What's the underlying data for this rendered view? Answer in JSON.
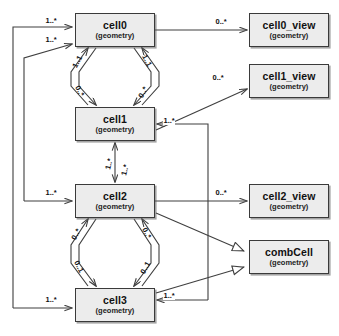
{
  "diagram": {
    "kind": "uml-class-diagram",
    "background_color": "#ffffff",
    "node_fill": "#ececec",
    "node_stroke": "#3a3a3a",
    "line_color": "#3f3f3f",
    "nodes": [
      {
        "id": "cell0",
        "name": "cell0",
        "stereotype": "(geometry)",
        "x": 75,
        "y": 13,
        "w": 80,
        "h": 34
      },
      {
        "id": "cell1",
        "name": "cell1",
        "stereotype": "(geometry)",
        "x": 75,
        "y": 107,
        "h": 34,
        "w": 80
      },
      {
        "id": "cell2",
        "name": "cell2",
        "stereotype": "(geometry)",
        "x": 75,
        "y": 184,
        "w": 80,
        "h": 34
      },
      {
        "id": "cell3",
        "name": "cell3",
        "stereotype": "(geometry)",
        "x": 75,
        "y": 288,
        "w": 80,
        "h": 34
      },
      {
        "id": "cell0_view",
        "name": "cell0_view",
        "stereotype": "(geometry)",
        "x": 249,
        "y": 13,
        "w": 80,
        "h": 34
      },
      {
        "id": "cell1_view",
        "name": "cell1_view",
        "stereotype": "(geometry)",
        "x": 249,
        "y": 64,
        "w": 80,
        "h": 34
      },
      {
        "id": "cell2_view",
        "name": "cell2_view",
        "stereotype": "(geometry)",
        "x": 249,
        "y": 184,
        "w": 80,
        "h": 34
      },
      {
        "id": "combCell",
        "name": "combCell",
        "stereotype": "(geometry)",
        "x": 249,
        "y": 240,
        "w": 80,
        "h": 34
      }
    ],
    "edges": [
      {
        "id": "e-cell0-cell0view",
        "from": "cell0",
        "to": "cell0_view",
        "label": "0..*",
        "arrow": "open"
      },
      {
        "id": "e-cell1-cell1view",
        "from": "cell1",
        "to": "cell1_view",
        "label": "0..*",
        "arrow": "open"
      },
      {
        "id": "e-cell2-cell2view",
        "from": "cell2",
        "to": "cell2_view",
        "label": "0..*",
        "arrow": "open"
      },
      {
        "id": "e-cell0-cell1-down",
        "from": "cell0",
        "to": "cell1",
        "label": "0..*",
        "arrow": "open"
      },
      {
        "id": "e-cell1-cell0-up",
        "from": "cell1",
        "to": "cell0",
        "label": "1..1",
        "arrow": "open"
      },
      {
        "id": "e-cell0-cell1-down2",
        "from": "cell0",
        "to": "cell1",
        "label": "0..*",
        "arrow": "open"
      },
      {
        "id": "e-cell1-cell0-up2",
        "from": "cell1",
        "to": "cell0",
        "label": "1..1",
        "arrow": "open"
      },
      {
        "id": "e-cell1-cell2",
        "from": "cell1",
        "to": "cell2",
        "label": "1..*",
        "arrow": "open-both"
      },
      {
        "id": "e-cell2-cell1",
        "from": "cell2",
        "to": "cell1",
        "label": "1..*",
        "arrow": "open-both"
      },
      {
        "id": "e-cell2-cell3-down",
        "from": "cell2",
        "to": "cell3",
        "label": "0..1",
        "arrow": "open"
      },
      {
        "id": "e-cell3-cell2-up",
        "from": "cell3",
        "to": "cell2",
        "label": "0..*",
        "arrow": "open"
      },
      {
        "id": "e-cell2-cell3-down2",
        "from": "cell2",
        "to": "cell3",
        "label": "0..1",
        "arrow": "open"
      },
      {
        "id": "e-cell3-cell2-up2",
        "from": "cell3",
        "to": "cell2",
        "label": "0..*",
        "arrow": "open"
      },
      {
        "id": "e-loop-cell0-a",
        "from": "cell3",
        "to": "cell0",
        "label": "1..*",
        "arrow": "open"
      },
      {
        "id": "e-loop-cell0-b",
        "from": "cell2",
        "to": "cell0",
        "label": "1..*",
        "arrow": "open"
      },
      {
        "id": "e-loop-cell2",
        "from": "cell3",
        "to": "cell2",
        "label": "1..*",
        "arrow": "open"
      },
      {
        "id": "e-loop-cell3",
        "from": "cell0",
        "to": "cell3",
        "label": "1..*",
        "arrow": "open"
      },
      {
        "id": "e-right-cell1",
        "from": "cell3",
        "to": "cell1",
        "label": "1..*",
        "arrow": "open"
      },
      {
        "id": "e-right-cell3",
        "from": "cell1",
        "to": "cell3",
        "label": "1..*",
        "arrow": "open"
      },
      {
        "id": "e-cell2-combcell",
        "from": "cell2",
        "to": "combCell",
        "label": "",
        "arrow": "generalization"
      },
      {
        "id": "e-cell3-combcell",
        "from": "cell3",
        "to": "combCell",
        "label": "",
        "arrow": "generalization"
      }
    ],
    "labels": {
      "l_top_left_1": "1..*",
      "l_top_left_2": "1..*",
      "l_cell0_view": "0..*",
      "l_cell1_view": "0..*",
      "l_cell2_view": "0..*",
      "l_c0c1_left_up": "1..1",
      "l_c0c1_right_up": "1..1",
      "l_c0c1_left_down": "0..*",
      "l_c0c1_right_down": "0..*",
      "l_c1c2_left": "1..*",
      "l_c1c2_right": "1..*",
      "l_cell1_right_in": "1..*",
      "l_cell2_left_in": "1..*",
      "l_c2c3_left_up": "0..*",
      "l_c2c3_right_up": "0..*",
      "l_c2c3_left_down": "0..1",
      "l_c2c3_right_down": "0..1",
      "l_cell3_left_in": "1..*",
      "l_cell3_right_in": "1..*"
    }
  }
}
